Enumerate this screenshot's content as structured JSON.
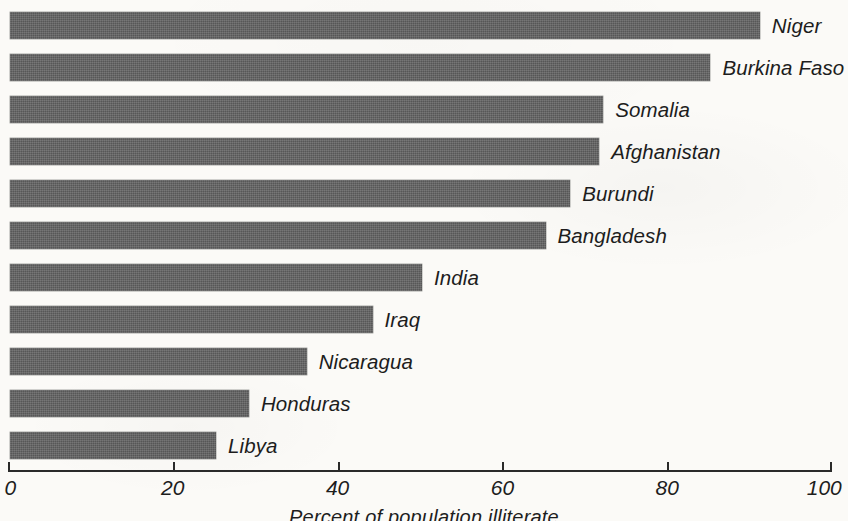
{
  "chart_data": {
    "type": "bar",
    "orientation": "horizontal",
    "title": "",
    "xlabel": "Percent of population illiterate",
    "ylabel": "",
    "xlim": [
      0,
      100
    ],
    "xticks": [
      0,
      20,
      40,
      60,
      80,
      100
    ],
    "xtick_labels": [
      "0",
      "20",
      "40",
      "60",
      "80",
      "100"
    ],
    "grid": false,
    "legend": false,
    "bar_color": "#575757",
    "background_color": "#fbfaf7",
    "text_color": "#1d1d1d",
    "categories": [
      "Niger",
      "Burkina Faso",
      "Somalia",
      "Afghanistan",
      "Burundi",
      "Bangladesh",
      "India",
      "Iraq",
      "Nicaragua",
      "Honduras",
      "Libya"
    ],
    "values": [
      91,
      85,
      72,
      71.5,
      68,
      65,
      50,
      44,
      36,
      29,
      25
    ],
    "bars": [
      {
        "label": "Niger",
        "value": 91
      },
      {
        "label": "Burkina Faso",
        "value": 85
      },
      {
        "label": "Somalia",
        "value": 72
      },
      {
        "label": "Afghanistan",
        "value": 71.5
      },
      {
        "label": "Burundi",
        "value": 68
      },
      {
        "label": "Bangladesh",
        "value": 65
      },
      {
        "label": "India",
        "value": 50
      },
      {
        "label": "Iraq",
        "value": 44
      },
      {
        "label": "Nicaragua",
        "value": 36
      },
      {
        "label": "Honduras",
        "value": 29
      },
      {
        "label": "Libya",
        "value": 25
      }
    ]
  },
  "layout": {
    "axis_x0_px": 8,
    "axis_x100_px": 832,
    "bar_left_px": 10,
    "bar_top_px": 12,
    "bar_height_px": 27,
    "bar_pitch_px": 42,
    "label_gap_px": 12
  }
}
